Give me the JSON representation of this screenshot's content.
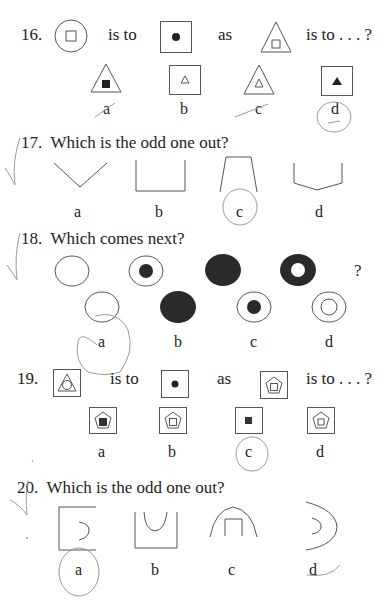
{
  "questions": [
    {
      "number": "16.",
      "type": "analogy",
      "connectors": [
        "is to",
        "as",
        "is to . . . ?"
      ],
      "prompt_figures": [
        "circle-with-small-square",
        "square-with-filled-dot",
        "triangle-with-small-square"
      ],
      "options": [
        {
          "label": "a",
          "figure": "triangle-with-filled-square"
        },
        {
          "label": "b",
          "figure": "square-with-small-triangle"
        },
        {
          "label": "c",
          "figure": "triangle-with-small-triangle"
        },
        {
          "label": "d",
          "figure": "square-with-filled-triangle",
          "circled": true
        }
      ]
    },
    {
      "number": "17.",
      "prompt": "Which is the odd one out?",
      "options": [
        {
          "label": "a",
          "figure": "v-shape"
        },
        {
          "label": "b",
          "figure": "open-square-u"
        },
        {
          "label": "c",
          "figure": "trapezoid-open-bottom",
          "circled": true
        },
        {
          "label": "d",
          "figure": "open-pentagon-cup"
        }
      ]
    },
    {
      "number": "18.",
      "prompt": "Which comes next?",
      "sequence": [
        "empty-circle",
        "circle-with-filled-dot",
        "filled-circle",
        "filled-ring",
        "?"
      ],
      "options": [
        {
          "label": "a",
          "figure": "empty-circle",
          "circled": true
        },
        {
          "label": "b",
          "figure": "filled-circle"
        },
        {
          "label": "c",
          "figure": "circle-with-filled-dot"
        },
        {
          "label": "d",
          "figure": "double-ring"
        }
      ]
    },
    {
      "number": "19.",
      "type": "analogy",
      "connectors": [
        "is to",
        "as",
        "is to . . . ?"
      ],
      "prompt_figures": [
        "square-triangle-circle",
        "square-with-filled-dot",
        "square-pentagon-square"
      ],
      "options": [
        {
          "label": "a",
          "figure": "square-pentagon-filled-square"
        },
        {
          "label": "b",
          "figure": "square-pentagon-square"
        },
        {
          "label": "c",
          "figure": "square-with-filled-square",
          "circled": true
        },
        {
          "label": "d",
          "figure": "square-pentagon-square-small"
        }
      ]
    },
    {
      "number": "20.",
      "prompt": "Which is the odd one out?",
      "options": [
        {
          "label": "a",
          "figure": "square-open-right-with-arc",
          "circled": true
        },
        {
          "label": "b",
          "figure": "square-open-top-with-u"
        },
        {
          "label": "c",
          "figure": "arch-with-open-square"
        },
        {
          "label": "d",
          "figure": "double-arc"
        }
      ]
    }
  ]
}
